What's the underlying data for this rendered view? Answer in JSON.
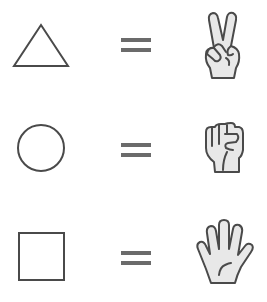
{
  "diagram": {
    "colors": {
      "background": "#ffffff",
      "stroke": "#4a4a4a",
      "equals": "#6b6b6b",
      "hand_fill": "#e8e8e8"
    },
    "rows": [
      {
        "shape": "triangle",
        "shape_icon": "triangle-icon",
        "relation": "=",
        "gesture": "peace sign (two fingers / scissors)",
        "gesture_icon": "peace-hand-icon"
      },
      {
        "shape": "circle",
        "shape_icon": "circle-icon",
        "relation": "=",
        "gesture": "closed fist (rock)",
        "gesture_icon": "fist-hand-icon"
      },
      {
        "shape": "square",
        "shape_icon": "square-icon",
        "relation": "=",
        "gesture": "open palm (paper)",
        "gesture_icon": "open-hand-icon"
      }
    ]
  }
}
